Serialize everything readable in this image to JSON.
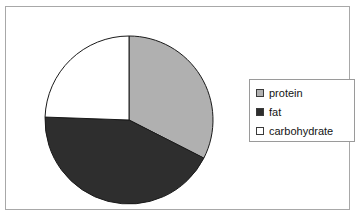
{
  "chart_data": {
    "type": "pie",
    "title": "",
    "categories": [
      "protein",
      "fat",
      "carbohydrate"
    ],
    "values": [
      32.5,
      43.0,
      24.5
    ],
    "unit": "percent",
    "colors": [
      "#b0b0b0",
      "#2e2e2e",
      "#ffffff"
    ],
    "slice_border_color": "#1a1a1a",
    "start_angle_deg": 0,
    "direction": "clockwise",
    "legend_position": "right",
    "grid": false,
    "slices": [
      {
        "label": "protein",
        "value": 32.5,
        "color": "#b0b0b0",
        "start_deg": 0,
        "end_deg": 117
      },
      {
        "label": "fat",
        "value": 43.0,
        "color": "#2e2e2e",
        "start_deg": 117,
        "end_deg": 272
      },
      {
        "label": "carbohydrate",
        "value": 24.5,
        "color": "#ffffff",
        "start_deg": 272,
        "end_deg": 360
      }
    ]
  },
  "legend": {
    "items": [
      {
        "label": "protein",
        "swatch_color": "#b0b0b0"
      },
      {
        "label": "fat",
        "swatch_color": "#2e2e2e"
      },
      {
        "label": "carbohydrate",
        "swatch_color": "#ffffff"
      }
    ]
  },
  "frame": {
    "border_color": "#a8a8a8",
    "background": "#ffffff"
  }
}
